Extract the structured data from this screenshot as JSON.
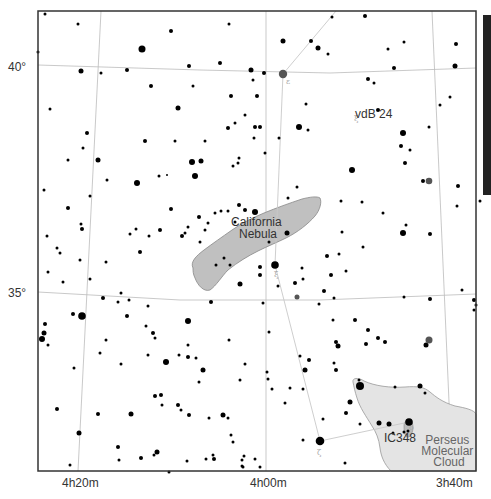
{
  "map": {
    "frame": {
      "x": 38,
      "y": 11,
      "width": 438,
      "height": 460
    },
    "colors": {
      "background": "#ffffff",
      "frame": "#333333",
      "grid": "#bbbbbb",
      "constellation_line": "#c8c8c8",
      "star": "#000000",
      "bright_star_gray": "#555555",
      "nebula_fill": "#c0c0c0",
      "nebula_stroke": "#888888",
      "cloud_fill": "#e4e4e4",
      "cloud_stroke": "#999999",
      "scale_bar": "#222222"
    },
    "dec_labels": [
      {
        "text": "40°",
        "x": 8,
        "y": 71
      },
      {
        "text": "35°",
        "x": 8,
        "y": 297
      }
    ],
    "ra_labels": [
      {
        "text": "4h20m",
        "x": 62,
        "y": 487
      },
      {
        "text": "4h00m",
        "x": 250,
        "y": 487
      },
      {
        "text": "3h40m",
        "x": 436,
        "y": 487
      }
    ],
    "grid_lines": {
      "dec": [
        {
          "label": "40°",
          "points": [
            [
              38,
              65
            ],
            [
              200,
              70
            ],
            [
              330,
              73
            ],
            [
              476,
              68
            ]
          ]
        },
        {
          "label": "35°",
          "points": [
            [
              38,
              292
            ],
            [
              180,
              300
            ],
            [
              320,
              300
            ],
            [
              476,
              294
            ]
          ]
        }
      ],
      "ra": [
        {
          "label": "4h20m",
          "points": [
            [
              101,
              11
            ],
            [
              78,
              471
            ]
          ]
        },
        {
          "label": "4h00m",
          "points": [
            [
              266,
              11
            ],
            [
              266,
              471
            ]
          ]
        },
        {
          "label": "3h40m",
          "points": [
            [
              432,
              11
            ],
            [
              452,
              471
            ]
          ]
        }
      ]
    },
    "constellation_lines": [
      [
        [
          336,
          11
        ],
        [
          283,
          74
        ]
      ],
      [
        [
          283,
          74
        ],
        [
          275,
          265
        ]
      ],
      [
        [
          275,
          265
        ],
        [
          320,
          441
        ]
      ],
      [
        [
          320,
          441
        ],
        [
          409,
          422
        ]
      ]
    ],
    "nebulae": [
      {
        "name": "California Nebula",
        "label_lines": [
          "California",
          "Nebula"
        ],
        "label_x": 258,
        "label_y": 226
      },
      {
        "name": "Perseus Molecular Cloud",
        "label_lines": [
          "Perseus",
          "Molecular",
          "Cloud"
        ],
        "label_x": 448,
        "label_y": 444
      }
    ],
    "objects": [
      {
        "name": "vdB 24",
        "label": "vdB 24",
        "x": 355,
        "y": 113
      },
      {
        "name": "IC348",
        "label": "IC348",
        "x": 399,
        "y": 441
      }
    ],
    "greek_letters": [
      {
        "char": "ε",
        "x": 286,
        "y": 84
      },
      {
        "char": "ξ",
        "x": 274,
        "y": 277
      },
      {
        "char": "ζ",
        "x": 317,
        "y": 455
      },
      {
        "char": "ο",
        "x": 409,
        "y": 430
      },
      {
        "char": "ξ",
        "x": 354,
        "y": 121
      }
    ],
    "scale_bar": {
      "x": 483,
      "y": 15,
      "width": 8,
      "height": 180
    },
    "stars": [
      [
        45,
        14,
        1.5
      ],
      [
        78,
        24,
        1.5
      ],
      [
        142,
        49,
        3.5
      ],
      [
        171,
        31,
        2
      ],
      [
        229,
        24,
        1.5
      ],
      [
        38,
        52,
        1.5
      ],
      [
        81,
        71,
        2.5
      ],
      [
        127,
        70,
        2
      ],
      [
        189,
        66,
        2
      ],
      [
        220,
        63,
        2
      ],
      [
        251,
        70,
        2.5
      ],
      [
        264,
        73,
        2
      ],
      [
        283,
        74,
        4.2
      ],
      [
        101,
        73,
        1.5
      ],
      [
        151,
        86,
        2
      ],
      [
        193,
        86,
        1.5
      ],
      [
        231,
        96,
        2
      ],
      [
        178,
        108,
        2.5
      ],
      [
        245,
        115,
        1.5
      ],
      [
        235,
        123,
        1.5
      ],
      [
        228,
        128,
        2
      ],
      [
        260,
        127,
        2
      ],
      [
        254,
        138,
        1.5
      ],
      [
        50,
        109,
        1.5
      ],
      [
        87,
        133,
        2
      ],
      [
        83,
        148,
        1.5
      ],
      [
        68,
        160,
        1.5
      ],
      [
        98,
        160,
        2.5
      ],
      [
        145,
        141,
        2
      ],
      [
        175,
        141,
        1.5
      ],
      [
        205,
        141,
        1.5
      ],
      [
        192,
        162,
        3
      ],
      [
        201,
        161,
        2.5
      ],
      [
        195,
        176,
        3
      ],
      [
        137,
        183,
        3
      ],
      [
        159,
        176,
        1.5
      ],
      [
        167,
        175,
        1
      ],
      [
        233,
        166,
        1.5
      ],
      [
        238,
        163,
        1.5
      ],
      [
        239,
        158,
        1.5
      ],
      [
        107,
        180,
        1.5
      ],
      [
        44,
        190,
        1.5
      ],
      [
        90,
        196,
        1.5
      ],
      [
        68,
        208,
        2
      ],
      [
        81,
        224,
        1.5
      ],
      [
        82,
        229,
        2
      ],
      [
        136,
        229,
        1.5
      ],
      [
        160,
        230,
        2
      ],
      [
        185,
        233,
        1.5
      ],
      [
        235,
        222,
        1.5
      ],
      [
        239,
        205,
        2
      ],
      [
        245,
        210,
        2
      ],
      [
        255,
        212,
        3
      ],
      [
        287,
        233,
        2.5
      ],
      [
        269,
        242,
        1.5
      ],
      [
        288,
        198,
        1.5
      ],
      [
        297,
        187,
        1.5
      ],
      [
        253,
        80,
        1.5
      ],
      [
        257,
        96,
        2
      ],
      [
        255,
        127,
        2
      ],
      [
        299,
        127,
        3
      ],
      [
        279,
        138,
        1.5
      ],
      [
        265,
        153,
        1.5
      ],
      [
        306,
        104,
        1.5
      ],
      [
        308,
        130,
        1.5
      ],
      [
        368,
        79,
        2
      ],
      [
        374,
        83,
        1.5
      ],
      [
        388,
        49,
        1.5
      ],
      [
        404,
        42,
        1.5
      ],
      [
        365,
        16,
        2
      ],
      [
        332,
        17,
        1.5
      ],
      [
        283,
        41,
        2.5
      ],
      [
        311,
        41,
        2
      ],
      [
        318,
        48,
        2.5
      ],
      [
        328,
        54,
        1.5
      ],
      [
        394,
        68,
        2
      ],
      [
        456,
        44,
        2
      ],
      [
        455,
        66,
        2.5
      ],
      [
        450,
        97,
        1.5
      ],
      [
        440,
        105,
        1.5
      ],
      [
        429,
        127,
        1.5
      ],
      [
        410,
        150,
        1.5
      ],
      [
        429,
        181,
        3.3
      ],
      [
        423,
        181,
        2
      ],
      [
        378,
        110,
        2
      ],
      [
        403,
        133,
        3
      ],
      [
        401,
        146,
        2
      ],
      [
        405,
        163,
        2
      ],
      [
        352,
        170,
        3
      ],
      [
        341,
        201,
        1.5
      ],
      [
        383,
        213,
        1.5
      ],
      [
        406,
        225,
        1.5
      ],
      [
        403,
        233,
        3
      ],
      [
        430,
        234,
        2
      ],
      [
        458,
        186,
        2
      ],
      [
        457,
        206,
        1.5
      ],
      [
        480,
        201,
        1.5
      ],
      [
        362,
        202,
        1.5
      ],
      [
        342,
        232,
        1.5
      ],
      [
        363,
        247,
        1.5
      ],
      [
        339,
        254,
        1.5
      ],
      [
        327,
        256,
        2
      ],
      [
        346,
        271,
        1.5
      ],
      [
        331,
        275,
        2
      ],
      [
        303,
        279,
        1.5
      ],
      [
        302,
        268,
        1.5
      ],
      [
        275,
        265,
        3.8
      ],
      [
        295,
        283,
        2
      ],
      [
        297,
        297,
        2.5
      ],
      [
        324,
        291,
        2
      ],
      [
        334,
        298,
        1.5
      ],
      [
        319,
        304,
        1.5
      ],
      [
        333,
        320,
        1.5
      ],
      [
        355,
        320,
        2
      ],
      [
        368,
        330,
        2
      ],
      [
        378,
        338,
        2
      ],
      [
        338,
        346,
        2.5
      ],
      [
        336,
        342,
        2
      ],
      [
        385,
        342,
        2
      ],
      [
        426,
        345,
        2.5
      ],
      [
        429,
        340,
        3.5
      ],
      [
        404,
        297,
        1.5
      ],
      [
        430,
        299,
        2
      ],
      [
        462,
        290,
        1.5
      ],
      [
        474,
        300,
        2
      ],
      [
        474,
        310,
        1.5
      ],
      [
        309,
        360,
        2
      ],
      [
        334,
        363,
        1.5
      ],
      [
        336,
        370,
        2
      ],
      [
        366,
        344,
        2
      ],
      [
        305,
        370,
        2.5
      ],
      [
        395,
        387,
        1.5
      ],
      [
        425,
        393,
        1.5
      ],
      [
        323,
        419,
        1.5
      ],
      [
        350,
        402,
        2.5
      ],
      [
        240,
        284,
        2.5
      ],
      [
        260,
        275,
        2
      ],
      [
        278,
        286,
        1.5
      ],
      [
        263,
        303,
        1.5
      ],
      [
        211,
        302,
        2
      ],
      [
        260,
        267,
        2
      ],
      [
        188,
        321,
        3
      ],
      [
        196,
        358,
        1.5
      ],
      [
        199,
        382,
        1.5
      ],
      [
        178,
        405,
        2
      ],
      [
        153,
        333,
        2
      ],
      [
        148,
        355,
        1.5
      ],
      [
        162,
        405,
        1.5
      ],
      [
        181,
        410,
        1.5
      ],
      [
        209,
        418,
        1.5
      ],
      [
        228,
        418,
        1.5
      ],
      [
        169,
        472,
        1.5
      ],
      [
        229,
        340,
        1.5
      ],
      [
        245,
        364,
        1.5
      ],
      [
        240,
        380,
        1.5
      ],
      [
        155,
        396,
        2
      ],
      [
        161,
        395,
        2
      ],
      [
        269,
        332,
        1.5
      ],
      [
        268,
        379,
        1.5
      ],
      [
        272,
        389,
        1.5
      ],
      [
        267,
        372,
        1.5
      ],
      [
        231,
        435,
        1.5
      ],
      [
        233,
        442,
        1.5
      ],
      [
        206,
        459,
        1.5
      ],
      [
        213,
        455,
        1.5
      ],
      [
        260,
        467,
        1.5
      ],
      [
        242,
        466,
        1.5
      ],
      [
        57,
        248,
        1.5
      ],
      [
        60,
        253,
        1.5
      ],
      [
        82,
        316,
        3.8
      ],
      [
        73,
        314,
        2
      ],
      [
        45,
        324,
        2
      ],
      [
        44,
        333,
        2.5
      ],
      [
        42,
        339,
        3
      ],
      [
        48,
        345,
        1.5
      ],
      [
        74,
        368,
        1.5
      ],
      [
        57,
        409,
        2
      ],
      [
        98,
        414,
        2
      ],
      [
        79,
        433,
        2.5
      ],
      [
        118,
        447,
        2
      ],
      [
        119,
        460,
        1.5
      ],
      [
        141,
        458,
        2
      ],
      [
        157,
        452,
        2.5
      ],
      [
        187,
        461,
        1.5
      ],
      [
        214,
        459,
        2
      ],
      [
        242,
        460,
        1.5
      ],
      [
        243,
        467,
        1.5
      ],
      [
        70,
        465,
        1.5
      ],
      [
        106,
        340,
        1.5
      ],
      [
        100,
        353,
        1.5
      ],
      [
        121,
        364,
        1.5
      ],
      [
        166,
        362,
        3
      ],
      [
        179,
        355,
        1.5
      ],
      [
        188,
        357,
        2
      ],
      [
        203,
        370,
        2.5
      ],
      [
        131,
        414,
        2.5
      ],
      [
        189,
        415,
        2
      ],
      [
        223,
        415,
        2.5
      ],
      [
        154,
        455,
        1.5
      ],
      [
        103,
        298,
        2
      ],
      [
        47,
        236,
        1.5
      ],
      [
        129,
        300,
        1.5
      ],
      [
        188,
        345,
        1.5
      ],
      [
        118,
        302,
        1.5
      ],
      [
        127,
        316,
        2
      ],
      [
        148,
        306,
        1.5
      ],
      [
        130,
        234,
        1.5
      ],
      [
        121,
        293,
        1.5
      ],
      [
        146,
        326,
        1.5
      ],
      [
        155,
        338,
        1.5
      ],
      [
        182,
        236,
        2
      ],
      [
        140,
        252,
        2
      ],
      [
        200,
        242,
        1.5
      ],
      [
        149,
        236,
        1.5
      ],
      [
        171,
        209,
        2
      ],
      [
        199,
        217,
        2
      ],
      [
        221,
        211,
        1.5
      ],
      [
        215,
        213,
        1.5
      ],
      [
        208,
        223,
        1.5
      ],
      [
        228,
        211,
        1.5
      ],
      [
        188,
        227,
        1.5
      ],
      [
        205,
        230,
        1.5
      ],
      [
        106,
        262,
        1.5
      ],
      [
        48,
        272,
        1.5
      ],
      [
        63,
        282,
        1.5
      ],
      [
        80,
        260,
        1.5
      ],
      [
        90,
        279,
        1.5
      ],
      [
        224,
        258,
        1.5
      ],
      [
        216,
        265,
        1.5
      ],
      [
        230,
        265,
        1.5
      ],
      [
        360,
        386,
        4
      ],
      [
        359,
        380,
        1.5
      ],
      [
        393,
        433,
        1.5
      ],
      [
        303,
        440,
        1.5
      ],
      [
        346,
        413,
        2
      ],
      [
        360,
        424,
        1.5
      ],
      [
        379,
        423,
        2.5
      ],
      [
        389,
        424,
        2.5
      ],
      [
        409,
        422,
        3.8
      ],
      [
        408,
        431,
        1.5
      ],
      [
        404,
        432,
        1.5
      ],
      [
        420,
        386,
        2.5
      ],
      [
        476,
        305,
        1.5
      ],
      [
        300,
        356,
        1.5
      ],
      [
        290,
        388,
        1.5
      ],
      [
        285,
        403,
        1.5
      ],
      [
        303,
        389,
        1.5
      ],
      [
        320,
        441,
        4.3
      ],
      [
        345,
        463,
        1.5
      ],
      [
        255,
        459,
        1.5
      ],
      [
        244,
        456,
        1.5
      ]
    ]
  }
}
